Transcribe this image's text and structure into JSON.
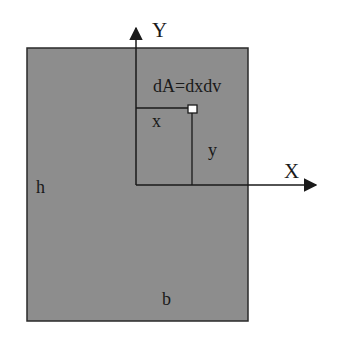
{
  "diagram": {
    "colors": {
      "fill": "#8d8d8d",
      "stroke": "#1a1a1a",
      "background": "#ffffff",
      "element": "#ffffff"
    },
    "labels": {
      "y_axis": "Y",
      "x_axis": "X",
      "element": "dA=dxdv",
      "x_dist": "x",
      "y_dist": "y",
      "height": "h",
      "base": "b"
    }
  }
}
